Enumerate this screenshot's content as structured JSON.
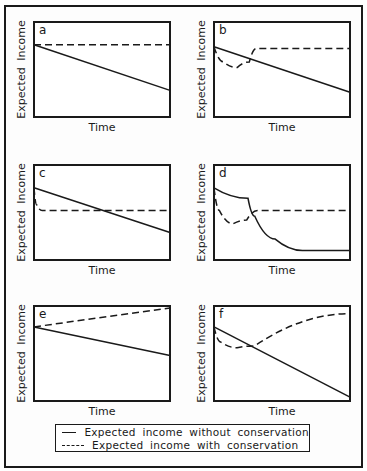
{
  "figure": {
    "y_axis_label": "Expected Income",
    "x_axis_label": "Time",
    "legend": [
      {
        "style": "solid",
        "label": "Expected income without conservation"
      },
      {
        "style": "dashed",
        "label": "Expected income with conservation"
      }
    ]
  },
  "chart_data": [
    {
      "panel": "a",
      "type": "line",
      "title": "a",
      "xlabel": "Time",
      "ylabel": "Expected Income",
      "grid": false,
      "ticks": false,
      "x": [
        0,
        1
      ],
      "series": [
        {
          "name": "Expected income without conservation",
          "style": "solid",
          "points": [
            [
              0,
              0.76
            ],
            [
              1,
              0.28
            ]
          ]
        },
        {
          "name": "Expected income with conservation",
          "style": "dashed",
          "points": [
            [
              0,
              0.76
            ],
            [
              1,
              0.76
            ]
          ]
        }
      ]
    },
    {
      "panel": "b",
      "type": "line",
      "title": "b",
      "xlabel": "Time",
      "ylabel": "Expected Income",
      "grid": false,
      "ticks": false,
      "series": [
        {
          "name": "Expected income without conservation",
          "style": "solid",
          "points": [
            [
              0,
              0.74
            ],
            [
              1,
              0.26
            ]
          ]
        },
        {
          "name": "Expected income with conservation",
          "style": "dashed",
          "points": [
            [
              0,
              0.74
            ],
            [
              0.07,
              0.58
            ],
            [
              0.17,
              0.52
            ],
            [
              0.26,
              0.58
            ],
            [
              0.31,
              0.72
            ],
            [
              0.32,
              0.72
            ],
            [
              1,
              0.72
            ]
          ]
        }
      ]
    },
    {
      "panel": "c",
      "type": "line",
      "title": "c",
      "xlabel": "Time",
      "ylabel": "Expected Income",
      "grid": false,
      "ticks": false,
      "series": [
        {
          "name": "Expected income without conservation",
          "style": "solid",
          "points": [
            [
              0,
              0.76
            ],
            [
              1,
              0.29
            ]
          ]
        },
        {
          "name": "Expected income with conservation",
          "style": "dashed",
          "points": [
            [
              0,
              0.76
            ],
            [
              0.02,
              0.58
            ],
            [
              0.06,
              0.52
            ],
            [
              1,
              0.52
            ]
          ]
        }
      ]
    },
    {
      "panel": "d",
      "type": "line",
      "title": "d",
      "xlabel": "Time",
      "ylabel": "Expected Income",
      "grid": false,
      "ticks": false,
      "series": [
        {
          "name": "Expected income without conservation",
          "style": "solid",
          "points": [
            [
              0,
              0.76
            ],
            [
              0.25,
              0.65
            ],
            [
              0.3,
              0.46
            ],
            [
              0.45,
              0.22
            ],
            [
              0.65,
              0.1
            ],
            [
              1,
              0.1
            ]
          ]
        },
        {
          "name": "Expected income with conservation",
          "style": "dashed",
          "points": [
            [
              0,
              0.76
            ],
            [
              0.04,
              0.52
            ],
            [
              0.14,
              0.38
            ],
            [
              0.24,
              0.42
            ],
            [
              0.32,
              0.52
            ],
            [
              1,
              0.52
            ]
          ]
        }
      ]
    },
    {
      "panel": "e",
      "type": "line",
      "title": "e",
      "xlabel": "Time",
      "ylabel": "Expected Income",
      "grid": false,
      "ticks": false,
      "series": [
        {
          "name": "Expected income without conservation",
          "style": "solid",
          "points": [
            [
              0,
              0.78
            ],
            [
              1,
              0.48
            ]
          ]
        },
        {
          "name": "Expected income with conservation",
          "style": "dashed",
          "points": [
            [
              0,
              0.78
            ],
            [
              1,
              0.98
            ]
          ]
        }
      ]
    },
    {
      "panel": "f",
      "type": "line",
      "title": "f",
      "xlabel": "Time",
      "ylabel": "Expected Income",
      "grid": false,
      "ticks": false,
      "series": [
        {
          "name": "Expected income without conservation",
          "style": "solid",
          "points": [
            [
              0,
              0.78
            ],
            [
              1,
              0.04
            ]
          ]
        },
        {
          "name": "Expected income with conservation",
          "style": "dashed",
          "points": [
            [
              0,
              0.78
            ],
            [
              0.05,
              0.62
            ],
            [
              0.17,
              0.56
            ],
            [
              0.3,
              0.58
            ],
            [
              1,
              0.92
            ]
          ]
        }
      ]
    }
  ]
}
